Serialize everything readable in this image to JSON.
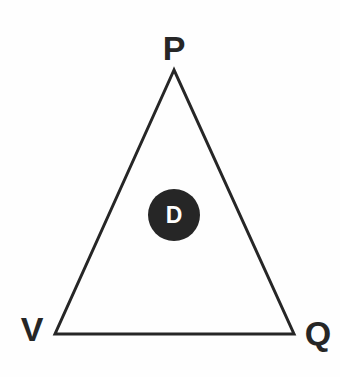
{
  "figure": {
    "type": "node-link-diagram",
    "shape": "triangle",
    "background_color": "#fefefe",
    "stroke_color": "#262626",
    "stroke_width": 3,
    "node_fill_color": "#262626",
    "node_text_color": "#ffffff",
    "label_color": "#262626"
  },
  "vertices": [
    {
      "id": "P",
      "label": "P",
      "x": 174,
      "y": 70,
      "label_x": 174,
      "label_y": 60
    },
    {
      "id": "V",
      "label": "V",
      "x": 55,
      "y": 334,
      "label_x": 32,
      "label_y": 341
    },
    {
      "id": "Q",
      "label": "Q",
      "x": 294,
      "y": 334,
      "label_x": 318,
      "label_y": 345
    }
  ],
  "edges": [
    {
      "from": "P",
      "to": "Q"
    },
    {
      "from": "Q",
      "to": "V"
    },
    {
      "from": "V",
      "to": "P"
    }
  ],
  "interior_node": {
    "id": "D",
    "label": "D",
    "cx": 174,
    "cy": 215,
    "r": 26
  }
}
